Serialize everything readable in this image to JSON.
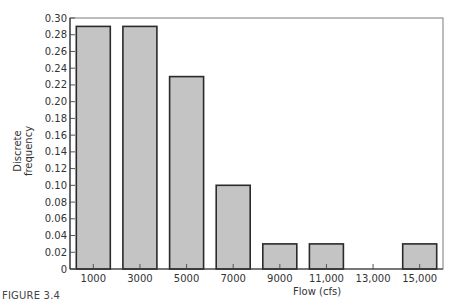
{
  "figure": {
    "caption": "FIGURE 3.4"
  },
  "chart_data": {
    "type": "bar",
    "title": "",
    "xlabel": "Flow (cfs)",
    "ylabel": "Discrete frequency",
    "categories": [
      "1000",
      "3000",
      "5000",
      "7000",
      "9000",
      "11,000",
      "13,000",
      "15,000"
    ],
    "values": [
      0.29,
      0.29,
      0.23,
      0.1,
      0.03,
      0.03,
      0.0,
      0.03
    ],
    "ylim": [
      0,
      0.3
    ],
    "yticks": [
      "0",
      "0.02",
      "0.04",
      "0.06",
      "0.08",
      "0.10",
      "0.12",
      "0.14",
      "0.16",
      "0.18",
      "0.20",
      "0.22",
      "0.24",
      "0.26",
      "0.28",
      "0.30"
    ],
    "grid": false,
    "legend": null,
    "bar_color": "#c4c4c4",
    "edge_color": "#2a2a2a"
  }
}
